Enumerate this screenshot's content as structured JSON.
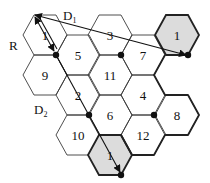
{
  "diagram": {
    "cell_radius_px": 22,
    "cells": [
      {
        "id": "c1a",
        "label": "1",
        "cx": 45,
        "cy": 35,
        "shaded": false
      },
      {
        "id": "c9",
        "label": "9",
        "cx": 45,
        "cy": 75,
        "shaded": false
      },
      {
        "id": "c5",
        "label": "5",
        "cx": 78,
        "cy": 55,
        "shaded": false
      },
      {
        "id": "c2",
        "label": "2",
        "cx": 78,
        "cy": 95,
        "shaded": false
      },
      {
        "id": "c10",
        "label": "10",
        "cx": 78,
        "cy": 135,
        "shaded": false
      },
      {
        "id": "c3",
        "label": "3",
        "cx": 110,
        "cy": 35,
        "shaded": false
      },
      {
        "id": "c11",
        "label": "11",
        "cx": 110,
        "cy": 75,
        "shaded": false
      },
      {
        "id": "c6",
        "label": "6",
        "cx": 110,
        "cy": 115,
        "shaded": false
      },
      {
        "id": "c1c",
        "label": "1",
        "cx": 110,
        "cy": 155,
        "shaded": true
      },
      {
        "id": "c7",
        "label": "7",
        "cx": 143,
        "cy": 55,
        "shaded": false
      },
      {
        "id": "c4",
        "label": "4",
        "cx": 143,
        "cy": 95,
        "shaded": false
      },
      {
        "id": "c12",
        "label": "12",
        "cx": 143,
        "cy": 135,
        "shaded": false
      },
      {
        "id": "c1b",
        "label": "1",
        "cx": 177,
        "cy": 35,
        "shaded": true
      },
      {
        "id": "c8",
        "label": "8",
        "cx": 177,
        "cy": 115,
        "shaded": false
      }
    ],
    "labels": {
      "radius": "R",
      "d1_main": "D",
      "d1_sub": "1",
      "d2_main": "D",
      "d2_sub": "2"
    },
    "dots": [
      [
        56,
        55
      ],
      [
        121,
        55
      ],
      [
        188,
        55
      ],
      [
        89,
        115
      ],
      [
        154,
        115
      ],
      [
        121,
        175
      ]
    ],
    "colors": {
      "line": "#3a3a3a",
      "bold_line": "#222222",
      "shaded_fill": "#dcdcdc",
      "dot": "#111111"
    }
  }
}
